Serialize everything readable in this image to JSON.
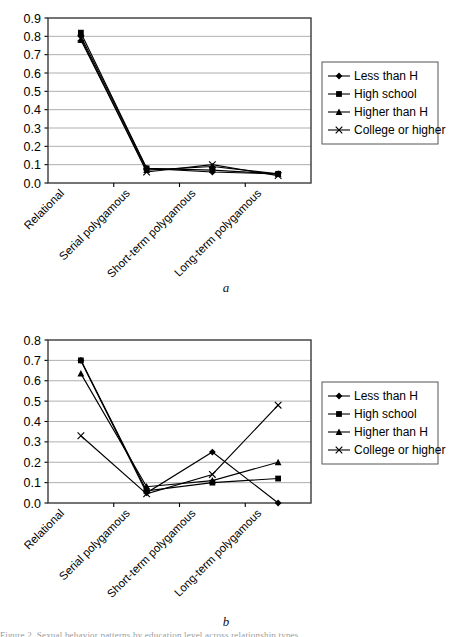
{
  "figure": {
    "caption_a": "a",
    "caption_b": "b",
    "footnote": "Figure 2. Sexual behavior patterns by education level across relationship types"
  },
  "legend": {
    "items": [
      {
        "label": "Less than H",
        "marker": "diamond"
      },
      {
        "label": "High school",
        "marker": "square"
      },
      {
        "label": "Higher than H",
        "marker": "triangle"
      },
      {
        "label": "College or higher",
        "marker": "cross"
      }
    ]
  },
  "chart_data": [
    {
      "type": "line",
      "panel": "a",
      "title": "",
      "xlabel": "",
      "ylabel": "",
      "categories": [
        "Relational",
        "Serial polygamous",
        "Short-term polygamous",
        "Long-term polygamous"
      ],
      "ylim": [
        0.0,
        0.9
      ],
      "yticks": [
        "0.0",
        "0.1",
        "0.2",
        "0.3",
        "0.4",
        "0.5",
        "0.6",
        "0.7",
        "0.8",
        "0.9"
      ],
      "grid": true,
      "legend_position": "right",
      "series": [
        {
          "name": "Less than H",
          "marker": "diamond",
          "values": [
            0.8,
            0.08,
            0.06,
            0.05
          ]
        },
        {
          "name": "High school",
          "marker": "square",
          "values": [
            0.82,
            0.08,
            0.07,
            0.05
          ]
        },
        {
          "name": "Higher than H",
          "marker": "triangle",
          "values": [
            0.78,
            0.07,
            0.09,
            0.05
          ]
        },
        {
          "name": "College or higher",
          "marker": "cross",
          "values": [
            0.79,
            0.06,
            0.1,
            0.04
          ]
        }
      ]
    },
    {
      "type": "line",
      "panel": "b",
      "title": "",
      "xlabel": "",
      "ylabel": "",
      "categories": [
        "Relational",
        "Serial polygamous",
        "Short-term polygamous",
        "Long-term polygamous"
      ],
      "ylim": [
        0.0,
        0.8
      ],
      "yticks": [
        "0.0",
        "0.1",
        "0.2",
        "0.3",
        "0.4",
        "0.5",
        "0.6",
        "0.7",
        "0.8"
      ],
      "grid": true,
      "legend_position": "right",
      "series": [
        {
          "name": "Less than H",
          "marker": "diamond",
          "values": [
            0.7,
            0.05,
            0.25,
            0.0
          ]
        },
        {
          "name": "High school",
          "marker": "square",
          "values": [
            0.7,
            0.06,
            0.1,
            0.12
          ]
        },
        {
          "name": "Higher than H",
          "marker": "triangle",
          "values": [
            0.635,
            0.08,
            0.11,
            0.2
          ]
        },
        {
          "name": "College or higher",
          "marker": "cross",
          "values": [
            0.33,
            0.045,
            0.14,
            0.48
          ]
        }
      ]
    }
  ]
}
